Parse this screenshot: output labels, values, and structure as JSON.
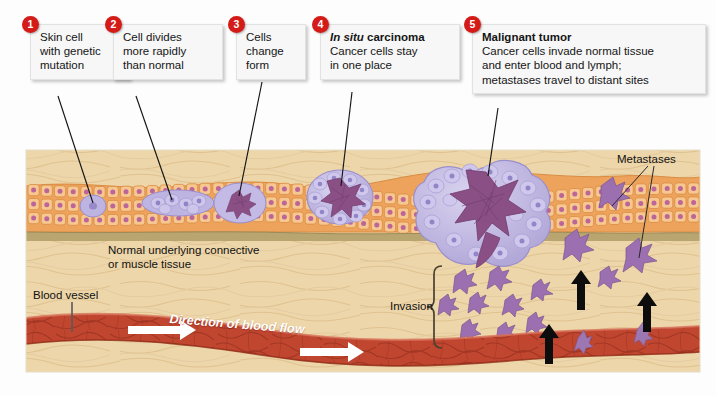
{
  "figure": {
    "title_alt": "Stages of cancer development from mutated skin cell to malignant tumor with metastasis",
    "steps": [
      {
        "number": "1",
        "title": "",
        "lines": [
          "Skin cell",
          "with genetic",
          "mutation"
        ]
      },
      {
        "number": "2",
        "title": "",
        "lines": [
          "Cell divides",
          "more rapidly",
          "than normal"
        ]
      },
      {
        "number": "3",
        "title": "",
        "lines": [
          "Cells",
          "change",
          "form"
        ]
      },
      {
        "number": "4",
        "title_italic": "In situ",
        "title_rest": " carcinoma",
        "lines": [
          "Cancer cells stay",
          "in one place"
        ]
      },
      {
        "number": "5",
        "title_plain": "Malignant tumor",
        "lines": [
          "Cancer cells invade normal tissue",
          "and enter blood and lymph;",
          "metastases travel to distant sites"
        ]
      }
    ],
    "labels": {
      "tissue_line1": "Normal underlying connective",
      "tissue_line2": "or muscle tissue",
      "blood_vessel": "Blood vessel",
      "blood_flow": "Direction of blood flow",
      "invasion": "Invasion",
      "metastases": "Metastases"
    },
    "colors": {
      "badge_red": "#d51b17",
      "epithelium_orange": "#eda35c",
      "epithelium_cell_fill": "#f6c389",
      "mutant_purple": "#b6aede",
      "tumor_core_purple": "#8a4f85",
      "connective_tan": "#eed6a8",
      "basement_olive": "#b4a06a",
      "vessel_red": "#c24833",
      "callout_bg": "#f7f7f7",
      "leader_line": "#1a1a1a"
    }
  }
}
